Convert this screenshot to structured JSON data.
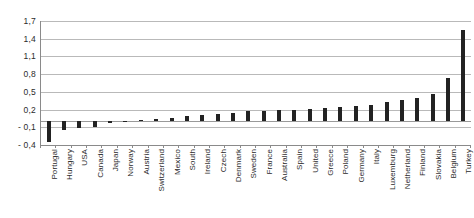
{
  "chart_data": {
    "type": "bar",
    "title": "",
    "subtitle": "",
    "xlabel": "",
    "ylabel": "",
    "ylim": [
      -0.4,
      1.7
    ],
    "grid": true,
    "legend": false,
    "decimal_separator": ",",
    "ytick_labels": [
      "1,7",
      "1,4",
      "1,1",
      "0,8",
      "0,5",
      "0,2",
      "- 0,1",
      "- 0,4"
    ],
    "ytick_values": [
      1.7,
      1.4,
      1.1,
      0.8,
      0.5,
      0.2,
      -0.1,
      -0.4
    ],
    "bar_color": "#222222",
    "categories": [
      "Portugal",
      "Hungary",
      "USA",
      "Canada",
      "Japan",
      "Norway",
      "Austria",
      "Switzerland",
      "Mexico",
      "South",
      "Ireland",
      "Czech",
      "Denmark",
      "Sweden",
      "France",
      "Australia",
      "Spain",
      "United",
      "Greece",
      "Poland",
      "Germany",
      "Italy",
      "Luxemburg",
      "Netherland",
      "Finland",
      "Slovakia",
      "Belgium",
      "Turkey"
    ],
    "values": [
      -0.35,
      -0.15,
      -0.11,
      -0.1,
      -0.02,
      0.01,
      0.03,
      0.04,
      0.06,
      0.09,
      0.11,
      0.13,
      0.15,
      0.17,
      0.18,
      0.19,
      0.2,
      0.21,
      0.22,
      0.24,
      0.26,
      0.28,
      0.32,
      0.36,
      0.4,
      0.47,
      0.73,
      1.55
    ]
  }
}
